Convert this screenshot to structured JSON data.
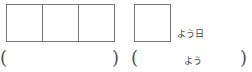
{
  "worksheet": {
    "group1": {
      "boxes": 3,
      "open_paren": "(",
      "close_paren": ")"
    },
    "group2": {
      "boxes": 1,
      "suffix_label": "よう日",
      "open_paren": "(",
      "reading_hint": "よう",
      "close_paren": ")"
    }
  }
}
